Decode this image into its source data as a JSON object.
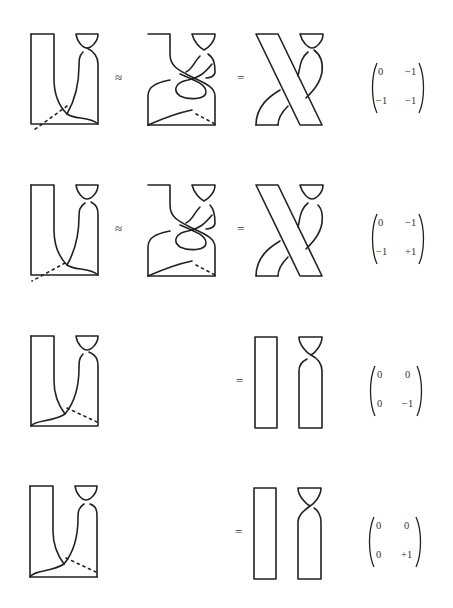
{
  "rows": [
    {
      "relation1": "≈",
      "relation2": "=",
      "matrix": {
        "a": "0",
        "b": "−1",
        "c": "−1",
        "d": "−1"
      }
    },
    {
      "relation1": "≈",
      "relation2": "=",
      "matrix": {
        "a": "0",
        "b": "−1",
        "c": "−1",
        "d": "+1"
      }
    },
    {
      "relation1": "",
      "relation2": "=",
      "matrix": {
        "a": "0",
        "b": "0",
        "c": "0",
        "d": "−1"
      }
    },
    {
      "relation1": "",
      "relation2": "=",
      "matrix": {
        "a": "0",
        "b": "0",
        "c": "0",
        "d": "+1"
      }
    }
  ]
}
